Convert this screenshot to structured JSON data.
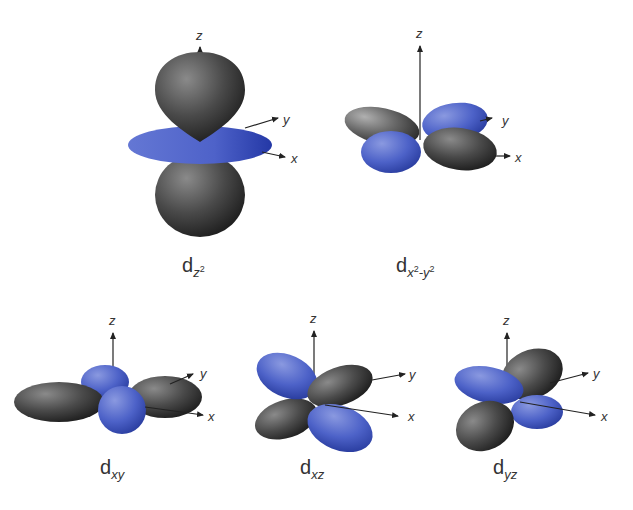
{
  "figure": {
    "colors": {
      "blue_lobe": "#4a5fc4",
      "blue_lobe_dark": "#2a3a9a",
      "gray_lobe": "#6e6e6e",
      "gray_lobe_dark": "#262626",
      "axis": "#222222",
      "text": "#333333"
    },
    "orbitals": [
      {
        "id": "dz2",
        "base": "d",
        "sub": "z",
        "sup": "2",
        "sub_tail": "",
        "sup_tail": "",
        "axes": {
          "x": "x",
          "y": "y",
          "z": "z"
        }
      },
      {
        "id": "dx2-y2",
        "base": "d",
        "sub": "x",
        "sup": "2",
        "sub_tail": "-y",
        "sup_tail": "2",
        "axes": {
          "x": "x",
          "y": "y",
          "z": "z"
        }
      },
      {
        "id": "dxy",
        "base": "d",
        "sub": "xy",
        "axes": {
          "x": "x",
          "y": "y",
          "z": "z"
        }
      },
      {
        "id": "dxz",
        "base": "d",
        "sub": "xz",
        "axes": {
          "x": "x",
          "y": "y",
          "z": "z"
        }
      },
      {
        "id": "dyz",
        "base": "d",
        "sub": "yz",
        "axes": {
          "x": "x",
          "y": "y",
          "z": "z"
        }
      }
    ]
  }
}
